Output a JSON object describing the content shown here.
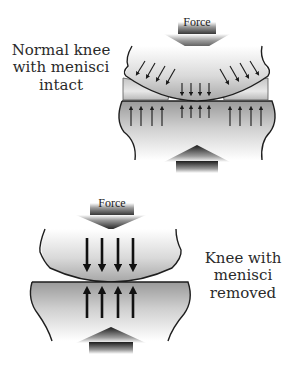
{
  "figure": {
    "top_panel": {
      "caption_lines": [
        "Normal knee",
        "with menisci",
        "intact"
      ],
      "force_label": "Force",
      "down_arrow_groups": [
        {
          "position": "left",
          "count": 4,
          "direction": "diagonal-down-left"
        },
        {
          "position": "center",
          "count": 4,
          "direction": "down"
        },
        {
          "position": "right",
          "count": 4,
          "direction": "diagonal-down-right"
        }
      ],
      "up_arrow_groups": [
        {
          "position": "left",
          "count": 4
        },
        {
          "position": "center",
          "count": 4
        },
        {
          "position": "right",
          "count": 4
        }
      ]
    },
    "bottom_panel": {
      "caption_lines": [
        "Knee with",
        "menisci",
        "removed"
      ],
      "force_label": "Force",
      "down_arrow_count": 4,
      "up_arrow_count": 4
    },
    "colors": {
      "bone_dark": "#8a8a8a",
      "bone_light": "#f2f2f2",
      "outline": "#1e1e1e",
      "arrow": "#1a1a1a",
      "text": "#2a2a2a"
    }
  }
}
